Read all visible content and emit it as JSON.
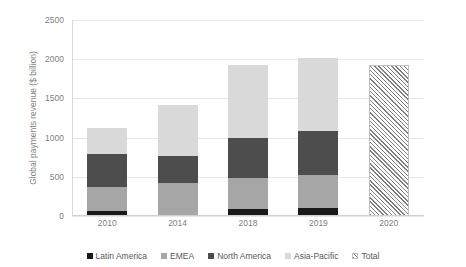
{
  "chart_data": {
    "type": "bar",
    "title": "",
    "subtitle": "",
    "xlabel": "",
    "ylabel": "Global payments revenue ($ billion)",
    "categories": [
      "2010",
      "2014",
      "2018",
      "2019",
      "2020"
    ],
    "ylim": [
      0,
      2500
    ],
    "yticks": [
      0,
      500,
      1000,
      1500,
      2000,
      2500
    ],
    "ytick_labels": [
      "0",
      "500",
      "1000",
      "1500",
      "2000",
      "2500"
    ],
    "grid": true,
    "stacked": true,
    "legend_position": "bottom",
    "series": [
      {
        "name": "Latin America",
        "color": "#1a1a1a",
        "values": [
          70,
          0,
          90,
          100,
          null
        ]
      },
      {
        "name": "EMEA",
        "color": "#a6a6a6",
        "values": [
          300,
          420,
          390,
          420,
          null
        ]
      },
      {
        "name": "North America",
        "color": "#4d4d4d",
        "values": [
          420,
          350,
          520,
          560,
          null
        ]
      },
      {
        "name": "Asia-Pacific",
        "color": "#d9d9d9",
        "values": [
          330,
          640,
          930,
          930,
          null
        ]
      },
      {
        "name": "Total",
        "color": "hatched",
        "values": [
          null,
          null,
          null,
          null,
          1930
        ]
      }
    ],
    "totals": [
      1120,
      1410,
      1930,
      2010,
      1930
    ],
    "annotations": []
  },
  "legend": {
    "items": [
      {
        "label": "Latin America",
        "key": "latin"
      },
      {
        "label": "EMEA",
        "key": "emea"
      },
      {
        "label": "North America",
        "key": "north"
      },
      {
        "label": "Asia-Pacific",
        "key": "asia"
      },
      {
        "label": "Total",
        "key": "total"
      }
    ]
  }
}
